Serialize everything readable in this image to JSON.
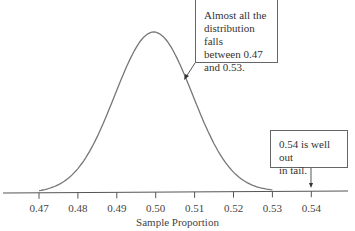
{
  "chart_data": {
    "type": "line",
    "title": "",
    "xlabel": "Sample Proportion",
    "ylabel": "",
    "x_ticks": [
      "0.47",
      "0.48",
      "0.49",
      "0.50",
      "0.51",
      "0.52",
      "0.53",
      "0.54"
    ],
    "xlim": [
      0.47,
      0.54
    ],
    "grid": false,
    "legend": null,
    "series": [
      {
        "name": "Sampling distribution (normal curve)",
        "mean": 0.5,
        "sd": 0.01,
        "support": [
          0.47,
          0.53
        ]
      }
    ],
    "annotations": [
      {
        "text": "Almost all the distribution falls between 0.47 and 0.53.",
        "points_to": "right flank of curve near 0.507"
      },
      {
        "text": "0.54 is well out in tail.",
        "points_to": 0.54
      }
    ]
  },
  "axis": {
    "ticks": [
      "0.47",
      "0.48",
      "0.49",
      "0.50",
      "0.51",
      "0.52",
      "0.53",
      "0.54"
    ],
    "label": "Sample Proportion"
  },
  "callouts": {
    "first": [
      "Almost all the",
      "distribution falls",
      "between 0.47",
      "and 0.53."
    ],
    "second": [
      "0.54 is well out",
      "in tail."
    ]
  }
}
